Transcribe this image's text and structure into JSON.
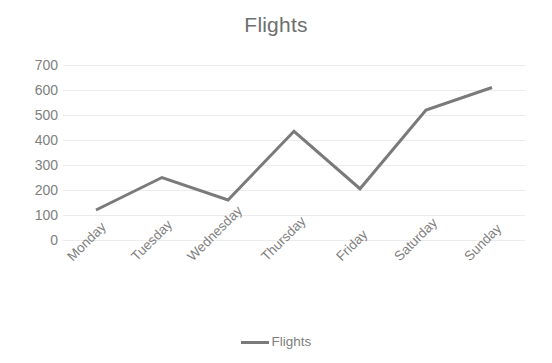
{
  "chart_data": {
    "type": "line",
    "title": "Flights",
    "xlabel": "",
    "ylabel": "",
    "categories": [
      "Monday",
      "Tuesday",
      "Wednesday",
      "Thursday",
      "Friday",
      "Saturday",
      "Sunday"
    ],
    "series": [
      {
        "name": "Flights",
        "values": [
          120,
          250,
          160,
          435,
          205,
          520,
          610
        ],
        "color": "#7a7a7a"
      }
    ],
    "ylim": [
      0,
      700
    ],
    "y_ticks": [
      0,
      100,
      200,
      300,
      400,
      500,
      600,
      700
    ],
    "y_tick_labels": [
      "0",
      "100",
      "200",
      "300",
      "400",
      "500",
      "600",
      "700"
    ],
    "grid": true,
    "grid_axis": "y",
    "grid_color": "#ececec",
    "legend": true,
    "legend_position": "bottom",
    "legend_entries": [
      "Flights"
    ],
    "markers": false,
    "x_tick_rotation": -45,
    "text_color": "#808080",
    "title_color": "#6e6e6e",
    "background": "#ffffff"
  }
}
